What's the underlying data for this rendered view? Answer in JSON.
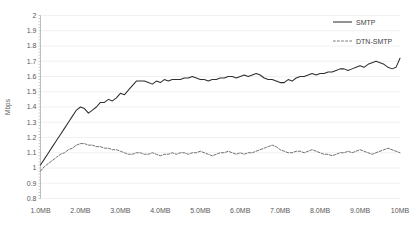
{
  "chart_data": {
    "type": "line",
    "title": "",
    "xlabel": "",
    "ylabel": "Mbps",
    "ylim": [
      0.8,
      2.0
    ],
    "ytick_step": 0.1,
    "yticks": [
      "0.8",
      "0.9",
      "1",
      "1.1",
      "1.2",
      "1.3",
      "1.4",
      "1.5",
      "1.6",
      "1.7",
      "1.8",
      "1.9",
      "2"
    ],
    "xticks": [
      "1.0MB",
      "2.0MB",
      "3.0MB",
      "4.0MB",
      "5.0MB",
      "6.0MB",
      "7.0MB",
      "8.0MB",
      "9.0MB",
      "10MB"
    ],
    "xlim": [
      1.0,
      10.0
    ],
    "grid": true,
    "grid_axis": "y",
    "legend_position": "top-right",
    "legend": [
      "SMTP",
      "DTN-SMTP"
    ],
    "x": [
      1.0,
      1.1,
      1.2,
      1.3,
      1.4,
      1.5,
      1.6,
      1.7,
      1.8,
      1.9,
      2.0,
      2.1,
      2.2,
      2.3,
      2.4,
      2.5,
      2.6,
      2.7,
      2.8,
      2.9,
      3.0,
      3.1,
      3.2,
      3.3,
      3.4,
      3.5,
      3.6,
      3.7,
      3.8,
      3.9,
      4.0,
      4.1,
      4.2,
      4.3,
      4.4,
      4.5,
      4.6,
      4.7,
      4.8,
      4.9,
      5.0,
      5.1,
      5.2,
      5.3,
      5.4,
      5.5,
      5.6,
      5.7,
      5.8,
      5.9,
      6.0,
      6.1,
      6.2,
      6.3,
      6.4,
      6.5,
      6.6,
      6.7,
      6.8,
      6.9,
      7.0,
      7.1,
      7.2,
      7.3,
      7.4,
      7.5,
      7.6,
      7.7,
      7.8,
      7.9,
      8.0,
      8.1,
      8.2,
      8.3,
      8.4,
      8.5,
      8.6,
      8.7,
      8.8,
      8.9,
      9.0,
      9.1,
      9.2,
      9.3,
      9.4,
      9.5,
      9.6,
      9.7,
      9.8,
      9.9,
      10.0
    ],
    "series": [
      {
        "name": "SMTP",
        "style": "solid",
        "color": "#2f2f2f",
        "values": [
          1.02,
          1.06,
          1.1,
          1.14,
          1.18,
          1.22,
          1.26,
          1.3,
          1.34,
          1.38,
          1.4,
          1.39,
          1.36,
          1.38,
          1.4,
          1.43,
          1.43,
          1.45,
          1.44,
          1.46,
          1.49,
          1.48,
          1.51,
          1.54,
          1.57,
          1.57,
          1.57,
          1.56,
          1.55,
          1.57,
          1.56,
          1.58,
          1.57,
          1.58,
          1.58,
          1.58,
          1.59,
          1.59,
          1.6,
          1.59,
          1.58,
          1.58,
          1.57,
          1.58,
          1.58,
          1.59,
          1.59,
          1.6,
          1.6,
          1.59,
          1.6,
          1.61,
          1.6,
          1.61,
          1.62,
          1.61,
          1.59,
          1.58,
          1.58,
          1.57,
          1.56,
          1.56,
          1.58,
          1.57,
          1.59,
          1.6,
          1.6,
          1.61,
          1.62,
          1.61,
          1.62,
          1.62,
          1.63,
          1.63,
          1.64,
          1.65,
          1.65,
          1.64,
          1.65,
          1.66,
          1.67,
          1.66,
          1.68,
          1.69,
          1.7,
          1.69,
          1.68,
          1.66,
          1.65,
          1.66,
          1.72
        ]
      },
      {
        "name": "DTN-SMTP",
        "style": "dashed",
        "color": "#5a5a5a",
        "values": [
          0.98,
          1.01,
          1.03,
          1.05,
          1.07,
          1.09,
          1.1,
          1.12,
          1.13,
          1.15,
          1.16,
          1.16,
          1.15,
          1.15,
          1.14,
          1.14,
          1.13,
          1.13,
          1.12,
          1.12,
          1.11,
          1.1,
          1.09,
          1.09,
          1.1,
          1.1,
          1.09,
          1.09,
          1.1,
          1.09,
          1.08,
          1.09,
          1.09,
          1.1,
          1.09,
          1.1,
          1.1,
          1.09,
          1.1,
          1.1,
          1.11,
          1.1,
          1.09,
          1.08,
          1.09,
          1.1,
          1.1,
          1.11,
          1.1,
          1.09,
          1.1,
          1.09,
          1.1,
          1.1,
          1.11,
          1.12,
          1.13,
          1.14,
          1.15,
          1.14,
          1.12,
          1.11,
          1.1,
          1.1,
          1.11,
          1.11,
          1.1,
          1.11,
          1.12,
          1.11,
          1.1,
          1.09,
          1.09,
          1.08,
          1.09,
          1.1,
          1.1,
          1.11,
          1.1,
          1.11,
          1.12,
          1.11,
          1.1,
          1.09,
          1.1,
          1.11,
          1.12,
          1.13,
          1.12,
          1.11,
          1.1
        ]
      }
    ]
  }
}
